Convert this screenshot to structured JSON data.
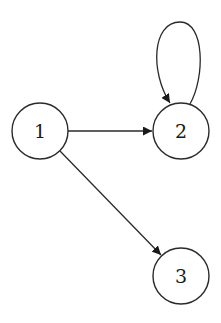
{
  "diagram": {
    "type": "directed-graph",
    "nodes": [
      {
        "id": "1",
        "label": "1",
        "cx": 40,
        "cy": 131,
        "r": 28
      },
      {
        "id": "2",
        "label": "2",
        "cx": 181,
        "cy": 131,
        "r": 28
      },
      {
        "id": "3",
        "label": "3",
        "cx": 181,
        "cy": 276,
        "r": 28
      }
    ],
    "edges": [
      {
        "from": "1",
        "to": "2",
        "kind": "straight"
      },
      {
        "from": "1",
        "to": "3",
        "kind": "straight"
      },
      {
        "from": "2",
        "to": "2",
        "kind": "self-loop"
      }
    ],
    "colors": {
      "stroke": "#2a2a2a",
      "fill": "#ffffff",
      "background": "#ffffff"
    }
  }
}
